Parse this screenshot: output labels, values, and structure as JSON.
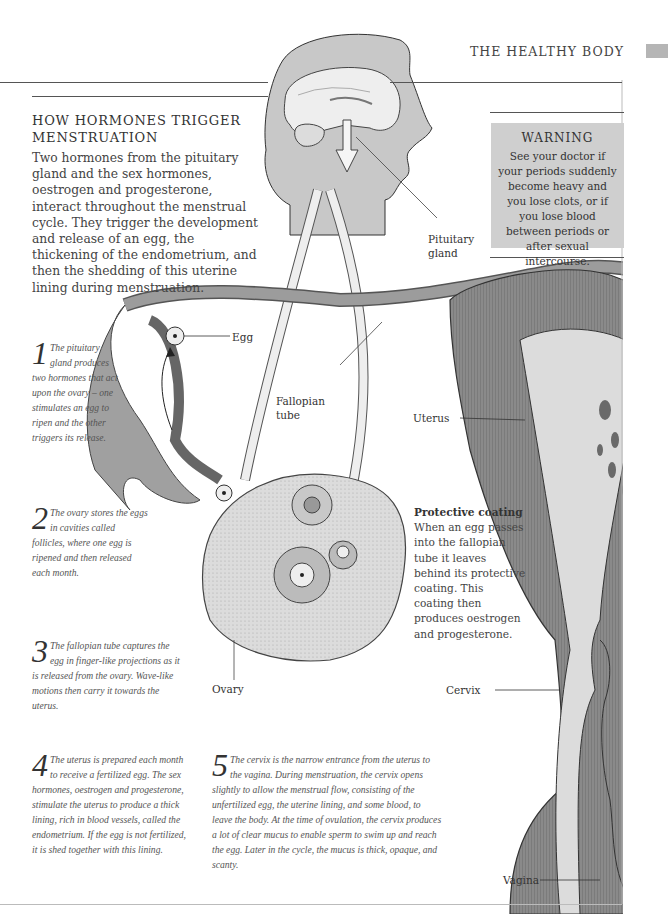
{
  "running_head": "THE HEALTHY BODY",
  "title_lines": [
    "HOW HORMONES TRIGGER",
    "MENSTRUATION"
  ],
  "intro": "Two hormones from the pituitary gland and the sex hormones, oestrogen and progesterone, interact throughout the menstrual cycle. They trigger the development and release of an egg, the thickening of the endometrium, and then the shedding of this uterine lining during menstruation.",
  "warning": {
    "heading": "WARNING",
    "text": "See your doctor if your periods suddenly become heavy and you lose clots, or if you lose blood between periods or after sexual intercourse."
  },
  "steps": [
    {
      "num": "1",
      "text": "The pituitary gland produces two hormones that act upon the ovary – one stimulates an egg to ripen and the other triggers its release."
    },
    {
      "num": "2",
      "text": "The ovary stores the eggs in cavities called follicles, where one egg is ripened and then released each month."
    },
    {
      "num": "3",
      "text": "The fallopian tube captures the egg in finger-like projections as it is released from the ovary. Wave-like motions then carry it towards the uterus."
    },
    {
      "num": "4",
      "text": "The uterus is prepared each month to receive a fertilized egg. The sex hormones, oestrogen and progesterone, stimulate the uterus to produce a thick lining, rich in blood vessels, called the endometrium. If the egg is not fertilized, it is shed together with this lining."
    },
    {
      "num": "5",
      "text": "The cervix is the narrow entrance from the uterus to the vagina. During menstruation, the cervix opens slightly to allow the menstrual flow, consisting of the unfertilized egg, the uterine lining, and some blood, to leave the body. At the time of ovulation, the cervix produces a lot of clear mucus to enable sperm to swim up and reach the egg. Later in the cycle, the mucus is thick, opaque, and scanty."
    }
  ],
  "protective_coating": {
    "heading": "Protective coating",
    "text": "When an egg passes into the fallopian tube it leaves behind its protective coating. This coating then produces oestrogen and progesterone."
  },
  "labels": {
    "pituitary": [
      "Pituitary",
      "gland"
    ],
    "egg": "Egg",
    "fallopian": [
      "Fallopian",
      "tube"
    ],
    "uterus": "Uterus",
    "ovary": "Ovary",
    "cervix": "Cervix",
    "vagina": "Vagina"
  },
  "colors": {
    "head_fill": "#c8c8c8",
    "warning_bg": "#cfcfcf",
    "tissue_dark": "#7a7a7a",
    "tissue_mid": "#a8a8a8",
    "tissue_light": "#e2e2e2",
    "tab": "#b5b5b5"
  }
}
